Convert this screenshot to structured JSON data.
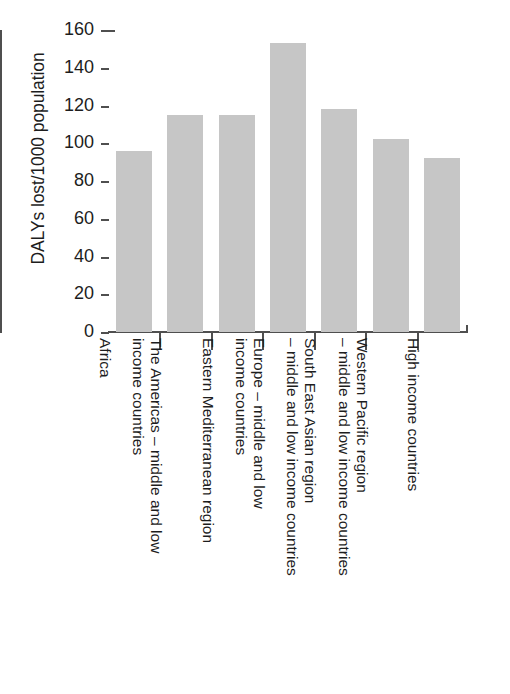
{
  "chart_data": {
    "type": "bar",
    "title": "",
    "xlabel": "",
    "ylabel": "DALYs lost/1000 population",
    "ylim": [
      0,
      160
    ],
    "yticks": [
      0,
      20,
      40,
      60,
      80,
      100,
      120,
      140,
      160
    ],
    "grid": false,
    "legend": "none",
    "bar_color": "#c6c6c6",
    "axis_color": "#4f4f4f",
    "categories": [
      "Africa",
      "The Americas – middle and low\nincome countries",
      "Eastern Mediterranean region",
      "Europe – middle and low\nincome countries",
      "South East Asian region\n– middle and low income countries",
      "Western Pacific region\n– middle and low income countries",
      "High income countries"
    ],
    "values": [
      96,
      115,
      115,
      153,
      118,
      102,
      92
    ]
  },
  "axis": {
    "y_title": "DALYs lost/1000 population",
    "tick_labels": [
      "160",
      "140",
      "120",
      "100",
      "80",
      "60",
      "40",
      "20",
      "0"
    ]
  }
}
